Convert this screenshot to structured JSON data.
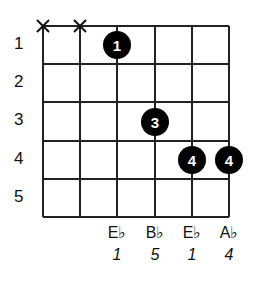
{
  "title": "",
  "frets": [
    "1",
    "2",
    "3",
    "4",
    "5"
  ],
  "muted_strings": [
    0,
    1
  ],
  "fingers": [
    {
      "string": 2,
      "fret": 1,
      "label": "1"
    },
    {
      "string": 3,
      "fret": 3,
      "label": "3"
    },
    {
      "string": 4,
      "fret": 4,
      "label": "4"
    },
    {
      "string": 5,
      "fret": 4,
      "label": "4"
    }
  ],
  "notes": [
    {
      "string": 2,
      "note": "E♭",
      "degree": "1"
    },
    {
      "string": 3,
      "note": "B♭",
      "degree": "5"
    },
    {
      "string": 4,
      "note": "E♭",
      "degree": "1"
    },
    {
      "string": 5,
      "note": "A♭",
      "degree": "4"
    }
  ]
}
